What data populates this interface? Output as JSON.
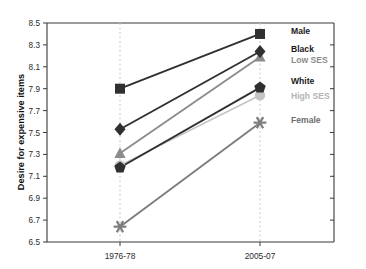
{
  "chart_data": {
    "type": "line",
    "title": "",
    "subtitle": "",
    "xlabel": "",
    "ylabel": "Desire for expensive items",
    "categories": [
      "1976-78",
      "2005-07"
    ],
    "x": [
      0,
      1
    ],
    "ylim": [
      6.5,
      8.5
    ],
    "ytick_step": 0.2,
    "yticks": [
      "8.5",
      "8.3",
      "8.1",
      "7.9",
      "7.7",
      "7.5",
      "7.3",
      "7.1",
      "6.9",
      "6.7",
      "6.5"
    ],
    "grid": false,
    "vertical_guides": true,
    "legend": "inline-right",
    "series": [
      {
        "name": "Male",
        "values": [
          7.9,
          8.4
        ],
        "marker": "square",
        "color": "#303030",
        "label_color": "#1a1a1a",
        "label_x": 291,
        "label_y": 31
      },
      {
        "name": "Black",
        "values": [
          7.53,
          8.24
        ],
        "marker": "diamond",
        "color": "#303030",
        "label_color": "#1a1a1a",
        "label_x": 291,
        "label_y": 49
      },
      {
        "name": "Low SES",
        "values": [
          7.31,
          8.19
        ],
        "marker": "triangle",
        "color": "#8c8c8c",
        "label_color": "#8c8c8c",
        "label_x": 291,
        "label_y": 60
      },
      {
        "name": "White",
        "values": [
          7.18,
          7.91
        ],
        "marker": "pentagon",
        "color": "#303030",
        "label_color": "#1a1a1a",
        "label_x": 291,
        "label_y": 81
      },
      {
        "name": "High SES",
        "values": [
          7.2,
          7.84
        ],
        "marker": "circle",
        "color": "#c4c4c4",
        "label_color": "#b4b4b4",
        "label_x": 291,
        "label_y": 96
      },
      {
        "name": "Female",
        "values": [
          6.64,
          7.59
        ],
        "marker": "asterisk",
        "color": "#7d7d7d",
        "label_color": "#6e6e6e",
        "label_x": 291,
        "label_y": 120
      }
    ]
  },
  "axes": {
    "y_axis_title": "Desire for expensive items",
    "x_tick_left": "1976-78",
    "x_tick_right": "2005-07"
  },
  "colors": {
    "background": "#ffffff",
    "axis": "#3a3a3a",
    "guide": "#c9c9c9",
    "dark_series": "#303030",
    "mid_series": "#8c8c8c",
    "light_series": "#c4c4c4"
  }
}
